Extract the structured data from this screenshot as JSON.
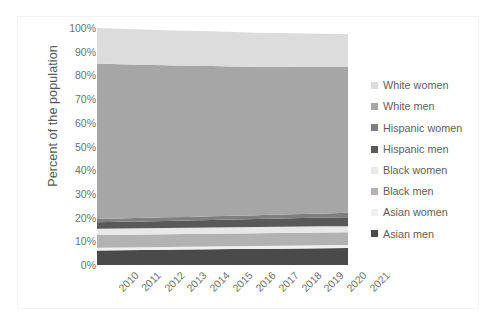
{
  "chart_data": {
    "type": "area",
    "title": "",
    "subtitle": "",
    "xlabel": "",
    "ylabel": "Percent of the population",
    "categories": [
      "2010",
      "2011",
      "2012",
      "2013",
      "2014",
      "2015",
      "2016",
      "2017",
      "2018",
      "2019",
      "2020",
      "2021"
    ],
    "x": [
      2010,
      2011,
      2012,
      2013,
      2014,
      2015,
      2016,
      2017,
      2018,
      2019,
      2020,
      2021
    ],
    "ylim": [
      0,
      100
    ],
    "ytick_labels": [
      "0%",
      "10%",
      "20%",
      "30%",
      "40%",
      "50%",
      "60%",
      "70%",
      "80%",
      "90%",
      "100%"
    ],
    "ytick_values": [
      0,
      10,
      20,
      30,
      40,
      50,
      60,
      70,
      80,
      90,
      100
    ],
    "grid": false,
    "stacked": true,
    "stack_order_bottom_to_top": [
      "Asian men",
      "Asian women",
      "Black men",
      "Black women",
      "Hispanic men",
      "Hispanic women",
      "White men",
      "White women"
    ],
    "legend_position": "right",
    "series": [
      {
        "name": "White women",
        "color": "#dcdcdc",
        "values": [
          15.0,
          15.0,
          14.9,
          14.8,
          14.7,
          14.6,
          14.5,
          14.4,
          14.3,
          14.2,
          14.1,
          14.0
        ]
      },
      {
        "name": "White men",
        "color": "#a6a6a6",
        "values": [
          65.6,
          65.1,
          64.6,
          64.2,
          63.8,
          63.4,
          63.0,
          62.6,
          62.3,
          62.0,
          61.8,
          61.5
        ]
      },
      {
        "name": "Hispanic women",
        "color": "#7f7f7f",
        "values": [
          1.4,
          1.4,
          1.5,
          1.5,
          1.5,
          1.6,
          1.6,
          1.6,
          1.7,
          1.7,
          1.7,
          1.8
        ]
      },
      {
        "name": "Hispanic men",
        "color": "#595959",
        "values": [
          2.7,
          2.8,
          2.9,
          3.0,
          3.1,
          3.2,
          3.3,
          3.4,
          3.5,
          3.6,
          3.7,
          3.8
        ]
      },
      {
        "name": "Black women",
        "color": "#e8e8e8",
        "values": [
          2.6,
          2.6,
          2.6,
          2.6,
          2.6,
          2.6,
          2.6,
          2.6,
          2.6,
          2.6,
          2.6,
          2.6
        ]
      },
      {
        "name": "Black men",
        "color": "#b2b2b2",
        "values": [
          5.4,
          5.4,
          5.4,
          5.4,
          5.4,
          5.4,
          5.4,
          5.4,
          5.4,
          5.4,
          5.4,
          5.4
        ]
      },
      {
        "name": "Asian women",
        "color": "#f0f0f0",
        "values": [
          1.2,
          1.2,
          1.2,
          1.2,
          1.2,
          1.2,
          1.2,
          1.2,
          1.2,
          1.2,
          1.2,
          1.2
        ]
      },
      {
        "name": "Asian men",
        "color": "#4a4a4a",
        "values": [
          6.1,
          6.2,
          6.3,
          6.4,
          6.5,
          6.6,
          6.7,
          6.8,
          6.9,
          7.0,
          7.1,
          7.2
        ]
      }
    ]
  },
  "legend": {
    "items": [
      {
        "label": "White women",
        "color": "#dcdcdc"
      },
      {
        "label": "White men",
        "color": "#a6a6a6"
      },
      {
        "label": "Hispanic women",
        "color": "#7f7f7f"
      },
      {
        "label": "Hispanic men",
        "color": "#595959"
      },
      {
        "label": "Black women",
        "color": "#e8e8e8"
      },
      {
        "label": "Black men",
        "color": "#b2b2b2"
      },
      {
        "label": "Asian women",
        "color": "#f0f0f0"
      },
      {
        "label": "Asian men",
        "color": "#4a4a4a"
      }
    ]
  },
  "axes": {
    "y_title": "Percent of the population",
    "y_labels": [
      "100%",
      "90%",
      "80%",
      "70%",
      "60%",
      "50%",
      "40%",
      "30%",
      "20%",
      "10%",
      "0%"
    ],
    "x_labels": [
      "2010",
      "2011",
      "2012",
      "2013",
      "2014",
      "2015",
      "2016",
      "2017",
      "2018",
      "2019",
      "2020",
      "2021"
    ]
  },
  "colors": {
    "axis_text": "#707070",
    "title_text": "#585858",
    "plot_background": "#ffffff",
    "frame_border": "#f3f3f3"
  }
}
